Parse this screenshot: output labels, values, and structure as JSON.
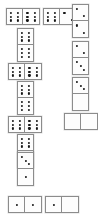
{
  "app": {
    "title": "Dominoes Board",
    "background_color": "#ffffff",
    "tile_face_color": "#fdfdfd",
    "tile_border_color": "#8c8c8c",
    "pip_color": "#151515"
  },
  "board": {
    "width": 98,
    "height": 222,
    "tile_short_side": 17,
    "tile_long_side": 34,
    "description": "Chain of domino tiles laid out in a path around the board"
  },
  "tiles": [
    {
      "id": "tile-1",
      "name": "domino-6-6-top-left",
      "orientation": "h",
      "x": 6,
      "y": 8,
      "w": 34,
      "h": 17,
      "values": [
        6,
        6
      ],
      "label": "6-6"
    },
    {
      "id": "tile-2",
      "name": "domino-6-2-top-right",
      "orientation": "h",
      "x": 43,
      "y": 8,
      "w": 34,
      "h": 17,
      "values": [
        6,
        2
      ],
      "label": "6-2"
    },
    {
      "id": "tile-3",
      "name": "domino-2-2-right-upper",
      "orientation": "v",
      "x": 72,
      "y": 4,
      "w": 17,
      "h": 34,
      "values": [
        2,
        2
      ],
      "label": "2-2"
    },
    {
      "id": "tile-4",
      "name": "domino-2-3-right-middle",
      "orientation": "v",
      "x": 72,
      "y": 41,
      "w": 17,
      "h": 34,
      "values": [
        2,
        3
      ],
      "label": "2-3"
    },
    {
      "id": "tile-5",
      "name": "domino-3-0-right-lower",
      "orientation": "v",
      "x": 72,
      "y": 77,
      "w": 17,
      "h": 34,
      "values": [
        3,
        0
      ],
      "label": "3-0"
    },
    {
      "id": "tile-6",
      "name": "domino-0-0-right-bottom",
      "orientation": "h",
      "x": 64,
      "y": 113,
      "w": 34,
      "h": 17,
      "values": [
        0,
        0
      ],
      "label": "0-0"
    },
    {
      "id": "tile-7",
      "name": "domino-6-6-left-upper-vertical",
      "orientation": "v",
      "x": 17,
      "y": 28,
      "w": 17,
      "h": 34,
      "values": [
        6,
        6
      ],
      "label": "6-6"
    },
    {
      "id": "tile-8",
      "name": "domino-6-6-left-horizontal-upper",
      "orientation": "h",
      "x": 8,
      "y": 63,
      "w": 34,
      "h": 17,
      "values": [
        6,
        6
      ],
      "label": "6-6"
    },
    {
      "id": "tile-9",
      "name": "domino-6-6-left-vertical-middle",
      "orientation": "v",
      "x": 17,
      "y": 81,
      "w": 17,
      "h": 34,
      "values": [
        6,
        6
      ],
      "label": "6-6"
    },
    {
      "id": "tile-10",
      "name": "domino-6-6-left-horizontal-lower",
      "orientation": "h",
      "x": 8,
      "y": 116,
      "w": 34,
      "h": 17,
      "values": [
        6,
        6
      ],
      "label": "6-6"
    },
    {
      "id": "tile-11",
      "name": "domino-6-3-left-vertical-lower",
      "orientation": "v",
      "x": 17,
      "y": 134,
      "w": 17,
      "h": 34,
      "values": [
        6,
        3
      ],
      "label": "6-3"
    },
    {
      "id": "tile-12",
      "name": "domino-3-1-left-vertical-bottom",
      "orientation": "v",
      "x": 17,
      "y": 152,
      "w": 17,
      "h": 34,
      "values": [
        3,
        1
      ],
      "label": "3-1"
    },
    {
      "id": "tile-13",
      "name": "domino-1-1-bottom-left",
      "orientation": "h",
      "x": 8,
      "y": 196,
      "w": 34,
      "h": 17,
      "values": [
        1,
        1
      ],
      "label": "1-1"
    },
    {
      "id": "tile-14",
      "name": "domino-1-0-bottom-right",
      "orientation": "h",
      "x": 45,
      "y": 196,
      "w": 34,
      "h": 17,
      "values": [
        1,
        0
      ],
      "label": "1-0"
    }
  ],
  "pip_layouts": {
    "0": [],
    "1": [
      [
        50,
        50
      ]
    ],
    "2": [
      [
        28,
        28
      ],
      [
        72,
        72
      ]
    ],
    "3": [
      [
        26,
        26
      ],
      [
        50,
        50
      ],
      [
        74,
        74
      ]
    ],
    "4": [
      [
        28,
        28
      ],
      [
        72,
        28
      ],
      [
        28,
        72
      ],
      [
        72,
        72
      ]
    ],
    "5": [
      [
        28,
        28
      ],
      [
        72,
        28
      ],
      [
        50,
        50
      ],
      [
        28,
        72
      ],
      [
        72,
        72
      ]
    ],
    "6": [
      [
        28,
        24
      ],
      [
        72,
        24
      ],
      [
        28,
        50
      ],
      [
        72,
        50
      ],
      [
        28,
        76
      ],
      [
        72,
        76
      ]
    ]
  }
}
